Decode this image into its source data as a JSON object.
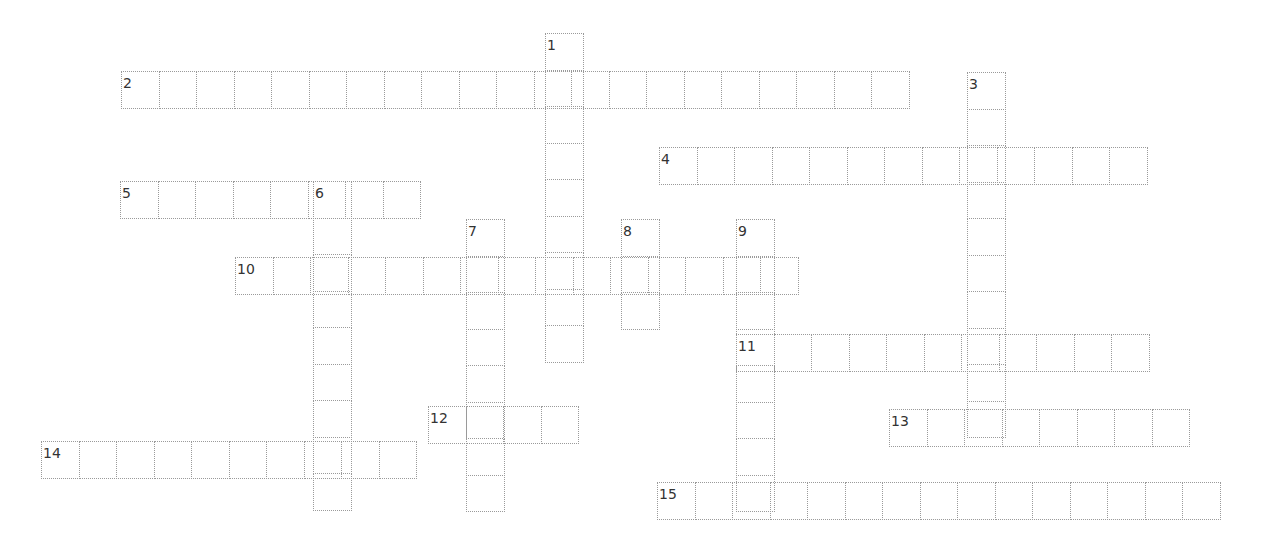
{
  "puzzle": {
    "type": "crossword",
    "cell_width": 38.5,
    "cell_height": 37.5,
    "border_color": "#9a9a9a",
    "number_color": "#333333",
    "words": [
      {
        "number": "1",
        "direction": "down",
        "x": 545,
        "y": 33,
        "length": 9
      },
      {
        "number": "2",
        "direction": "across",
        "x": 121,
        "y": 71,
        "length": 21
      },
      {
        "number": "3",
        "direction": "down",
        "x": 967,
        "y": 72,
        "length": 10
      },
      {
        "number": "4",
        "direction": "across",
        "x": 659,
        "y": 147,
        "length": 13
      },
      {
        "number": "5",
        "direction": "across",
        "x": 120,
        "y": 181,
        "length": 8
      },
      {
        "number": "6",
        "direction": "down",
        "x": 313,
        "y": 181,
        "length": 9
      },
      {
        "number": "7",
        "direction": "down",
        "x": 466,
        "y": 219,
        "length": 8
      },
      {
        "number": "8",
        "direction": "down",
        "x": 621,
        "y": 219,
        "length": 3
      },
      {
        "number": "9",
        "direction": "down",
        "x": 736,
        "y": 219,
        "length": 8
      },
      {
        "number": "10",
        "direction": "across",
        "x": 235,
        "y": 257,
        "length": 15
      },
      {
        "number": "11",
        "direction": "across",
        "x": 736,
        "y": 334,
        "length": 11
      },
      {
        "number": "12",
        "direction": "across",
        "x": 428,
        "y": 406,
        "length": 4
      },
      {
        "number": "13",
        "direction": "across",
        "x": 889,
        "y": 409,
        "length": 8
      },
      {
        "number": "14",
        "direction": "across",
        "x": 41,
        "y": 441,
        "length": 10
      },
      {
        "number": "15",
        "direction": "across",
        "x": 657,
        "y": 482,
        "length": 15
      }
    ]
  }
}
